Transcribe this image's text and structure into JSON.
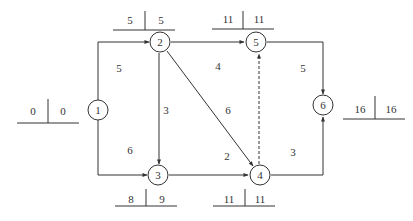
{
  "diagram": {
    "type": "activity-on-arrow network (critical path)",
    "nodes": [
      {
        "id": "1",
        "label": "1",
        "x": 98,
        "y": 110,
        "es": "0",
        "ls": "0",
        "table": {
          "x1": 17,
          "x2": 79,
          "y": 123,
          "divx": 48,
          "top": 99
        }
      },
      {
        "id": "2",
        "label": "2",
        "x": 160,
        "y": 42,
        "es": "5",
        "ls": "5",
        "table": {
          "x1": 113,
          "x2": 175,
          "y": 30,
          "divx": 145,
          "top": 11
        }
      },
      {
        "id": "3",
        "label": "3",
        "x": 158,
        "y": 175,
        "es": "8",
        "ls": "9",
        "table": {
          "x1": 115,
          "x2": 177,
          "y": 206,
          "divx": 146,
          "top": 189
        }
      },
      {
        "id": "4",
        "label": "4",
        "x": 260,
        "y": 175,
        "es": "11",
        "ls": "11",
        "table": {
          "x1": 213,
          "x2": 275,
          "y": 206,
          "divx": 245,
          "top": 189
        }
      },
      {
        "id": "5",
        "label": "5",
        "x": 256,
        "y": 42,
        "es": "11",
        "ls": "11",
        "table": {
          "x1": 212,
          "x2": 274,
          "y": 30,
          "divx": 243,
          "top": 11
        }
      },
      {
        "id": "6",
        "label": "6",
        "x": 323,
        "y": 110,
        "es": "16",
        "ls": "16",
        "table": {
          "x1": 343,
          "x2": 405,
          "y": 119,
          "divx": 375,
          "top": 96
        }
      }
    ],
    "edges": [
      {
        "from": "1",
        "to": "2",
        "duration": "5",
        "dashed": false,
        "label_x": 119,
        "label_y": 72
      },
      {
        "from": "1",
        "to": "3",
        "duration": "6",
        "dashed": false,
        "label_x": 130,
        "label_y": 154
      },
      {
        "from": "2",
        "to": "3",
        "duration": "3",
        "dashed": false,
        "label_x": 165,
        "label_y": 114
      },
      {
        "from": "2",
        "to": "5",
        "duration": "4",
        "dashed": false,
        "label_x": 218,
        "label_y": 70
      },
      {
        "from": "2",
        "to": "4",
        "duration": "6",
        "dashed": false,
        "label_x": 228,
        "label_y": 114
      },
      {
        "from": "3",
        "to": "4",
        "duration": "2",
        "dashed": false,
        "label_x": 227,
        "label_y": 160
      },
      {
        "from": "4",
        "to": "5",
        "duration": "",
        "dashed": true
      },
      {
        "from": "5",
        "to": "6",
        "duration": "5",
        "dashed": false,
        "label_x": 303,
        "label_y": 72
      },
      {
        "from": "4",
        "to": "6",
        "duration": "3",
        "dashed": false,
        "label_x": 293,
        "label_y": 156
      }
    ]
  },
  "labels": {
    "n1": "1",
    "n2": "2",
    "n3": "3",
    "n4": "4",
    "n5": "5",
    "n6": "6",
    "t1_left": "0",
    "t1_right": "0",
    "t2_left": "5",
    "t2_right": "5",
    "t3_left": "8",
    "t3_right": "9",
    "t4_left": "11",
    "t4_right": "11",
    "t5_left": "11",
    "t5_right": "11",
    "t6_left": "16",
    "t6_right": "16",
    "e12": "5",
    "e13": "6",
    "e23": "3",
    "e25": "4",
    "e24": "6",
    "e34": "2",
    "e56": "5",
    "e46": "3"
  },
  "colors": {
    "line": "#333333",
    "background": "#ffffff"
  }
}
